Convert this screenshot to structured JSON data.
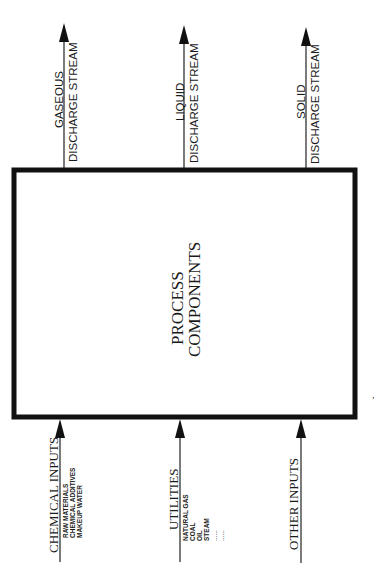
{
  "diagram": {
    "colors": {
      "ink": "#111111",
      "background": "#ffffff"
    },
    "process_box": {
      "label_line1": "PROCESS",
      "label_line2": "COMPONENTS"
    },
    "outputs": [
      {
        "id": "gaseous",
        "line1": "GASEOUS",
        "line2": "DISCHARGE  STREAM"
      },
      {
        "id": "liquid",
        "line1": "LIQUID",
        "line2": "DISCHARGE  STREAM"
      },
      {
        "id": "solid",
        "line1": "SOLID",
        "line2": "DISCHARGE  STREAM"
      }
    ],
    "inputs": [
      {
        "id": "chemical",
        "label": "CHEMICAL  INPUTS",
        "items": [
          "RAW  MATERIALS",
          "CHEMICAL  ADDITIVES",
          "MAKEUP  WATER"
        ]
      },
      {
        "id": "utilities",
        "label": "UTILITIES",
        "items": [
          "NATURAL  GAS",
          "COAL",
          "OIL",
          "STEAM",
          "......",
          "......"
        ]
      },
      {
        "id": "other",
        "label": "OTHER  INPUTS",
        "items": []
      }
    ],
    "annotations": {
      "stray_mark": ","
    }
  }
}
